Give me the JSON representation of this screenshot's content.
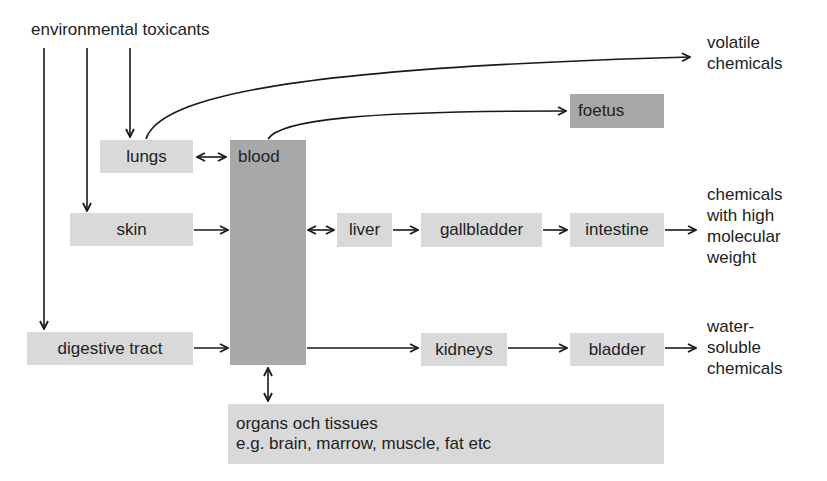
{
  "diagram": {
    "source_label": "environmental toxicants",
    "nodes": {
      "lungs": "lungs",
      "blood": "blood",
      "skin": "skin",
      "digestive_tract": "digestive tract",
      "foetus": "foetus",
      "liver": "liver",
      "gallbladder": "gallbladder",
      "intestine": "intestine",
      "kidneys": "kidneys",
      "bladder": "bladder",
      "organs_line1": "organs och tissues",
      "organs_line2": "e.g. brain, marrow, muscle, fat etc"
    },
    "outputs": {
      "volatile": [
        "volatile",
        "chemicals"
      ],
      "high_molecular": [
        "chemicals",
        "with high",
        "molecular",
        "weight"
      ],
      "water_soluble": [
        "water-",
        "soluble",
        "chemicals"
      ]
    },
    "colors": {
      "light_box": "#d9d9d9",
      "dark_box": "#a8a8a8",
      "line": "#1a1a1a",
      "text": "#222222"
    }
  }
}
